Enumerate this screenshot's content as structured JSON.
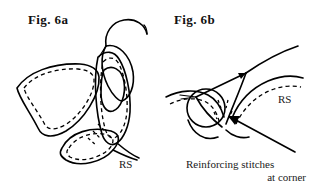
{
  "page": {
    "width": 316,
    "height": 189,
    "background_color": "#ffffff",
    "ink_color": "#000000",
    "type": "line-art-sewing-instruction-diagram"
  },
  "figures": [
    {
      "id": "fig-6a",
      "label": "Fig. 6a",
      "rs_label": "RS",
      "description": "Two petal pieces joined at corner, needle and thread passing through upper petal tip"
    },
    {
      "id": "fig-6b",
      "label": "Fig. 6b",
      "rs_label": "RS",
      "description": "Petal seam at corner with thread loop, needle drawn through, arrow indicating corner"
    }
  ],
  "caption": {
    "line1": "Reinforcing stitches",
    "line2": "at corner"
  }
}
